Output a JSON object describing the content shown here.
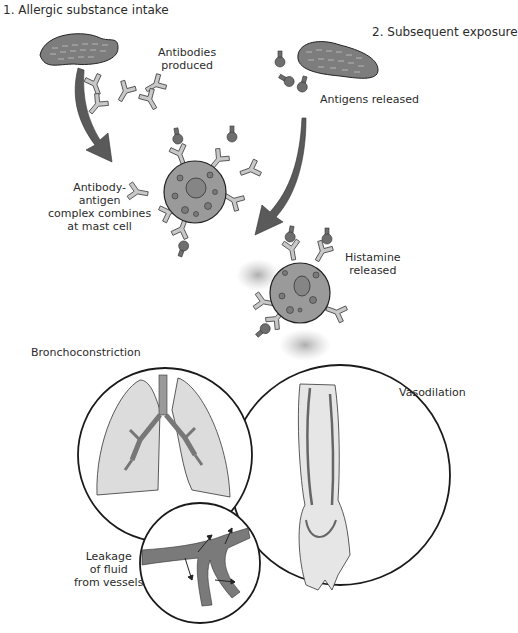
{
  "diagram": {
    "steps": [
      {
        "id": 1,
        "label": "1. Allergic substance intake"
      },
      {
        "id": 2,
        "label": "2. Subsequent exposure"
      }
    ],
    "annotations": {
      "antibodies_produced": [
        "Antibodies",
        "produced"
      ],
      "antigens_released": "Antigens released",
      "complex_combines": [
        "Antibody-",
        "antigen",
        "complex combines",
        "at mast cell"
      ],
      "histamine_released": [
        "Histamine",
        "released"
      ],
      "bronchoconstriction": "Bronchoconstriction",
      "vasodilation": "Vasodilation",
      "leakage": [
        "Leakage",
        "of fluid",
        "from vessels"
      ]
    },
    "colors": {
      "outline": "#1a1a1a",
      "peanut_fill": "#7d7d7d",
      "cell_fill": "#9a9a9a",
      "antibody_fill": "#c8c8c8",
      "antigen_fill": "#6e6e6e",
      "arrow_fill": "#5a5a5a",
      "lung_fill": "#dcdcdc",
      "vessel_fill": "#7a7a7a",
      "skin_fill": "#e6e6e6"
    }
  }
}
